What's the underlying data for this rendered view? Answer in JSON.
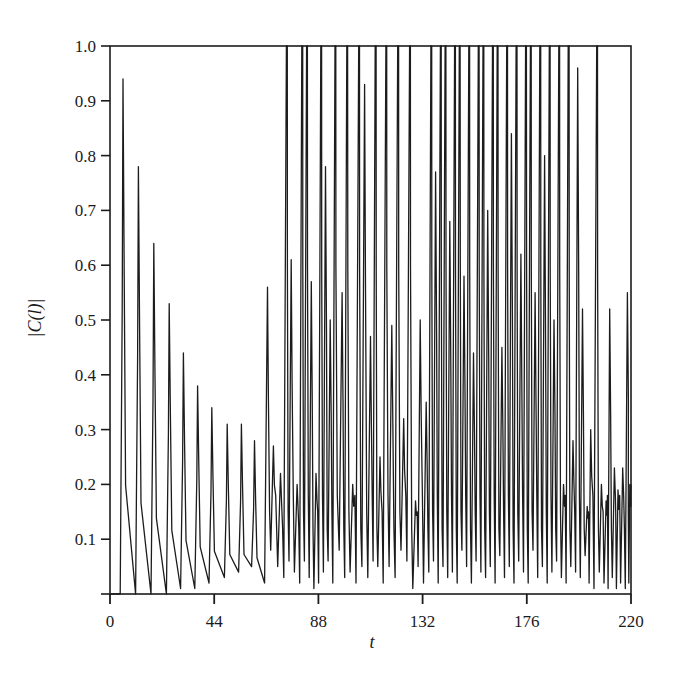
{
  "chart_data": {
    "type": "line",
    "title": "",
    "xlabel": "t",
    "ylabel": "|C(l)|",
    "xlim": [
      0,
      220
    ],
    "ylim": [
      0,
      1.0
    ],
    "grid": false,
    "legend": null,
    "x_ticks": [
      0,
      44,
      88,
      132,
      176,
      220
    ],
    "x_tick_labels": [
      "0",
      "44",
      "88",
      "132",
      "176",
      "220"
    ],
    "y_ticks": [
      0.1,
      0.2,
      0.3,
      0.4,
      0.5,
      0.6,
      0.7,
      0.8,
      0.9,
      1.0
    ],
    "y_tick_labels": [
      "0.1",
      "0.2",
      "0.3",
      "0.4",
      "0.5",
      "0.6",
      "0.7",
      "0.8",
      "0.9",
      "1.0"
    ],
    "series": [
      {
        "name": "|C(l)|",
        "peaks": [
          {
            "t": 5.5,
            "v": 0.94,
            "trough": 0.0
          },
          {
            "t": 12,
            "v": 0.78,
            "trough": 0.0
          },
          {
            "t": 18.5,
            "v": 0.64,
            "trough": 0.0
          },
          {
            "t": 25,
            "v": 0.53,
            "trough": 0.0
          },
          {
            "t": 31,
            "v": 0.44,
            "trough": 0.01
          },
          {
            "t": 37,
            "v": 0.38,
            "trough": 0.01
          },
          {
            "t": 43,
            "v": 0.34,
            "trough": 0.02
          },
          {
            "t": 49.5,
            "v": 0.31,
            "trough": 0.03
          },
          {
            "t": 55.5,
            "v": 0.31,
            "trough": 0.04
          },
          {
            "t": 61,
            "v": 0.28,
            "trough": 0.05
          },
          {
            "t": 66.5,
            "v": 0.56,
            "trough": 0.02
          },
          {
            "t": 69,
            "v": 0.27,
            "trough": 0.08
          },
          {
            "t": 72,
            "v": 0.22,
            "trough": 0.05
          },
          {
            "t": 74.5,
            "v": 1.0,
            "trough": 0.03
          },
          {
            "t": 76.5,
            "v": 0.61,
            "trough": 0.06
          },
          {
            "t": 79,
            "v": 0.2,
            "trough": 0.04
          },
          {
            "t": 81,
            "v": 1.0,
            "trough": 0.02
          },
          {
            "t": 83,
            "v": 1.0,
            "trough": 0.06
          },
          {
            "t": 85,
            "v": 0.57,
            "trough": 0.03
          },
          {
            "t": 87,
            "v": 0.22,
            "trough": 0.01
          },
          {
            "t": 89,
            "v": 1.0,
            "trough": 0.02
          },
          {
            "t": 91,
            "v": 0.78,
            "trough": 0.04
          },
          {
            "t": 93,
            "v": 0.5,
            "trough": 0.06
          },
          {
            "t": 95,
            "v": 1.0,
            "trough": 0.02
          },
          {
            "t": 98,
            "v": 0.55,
            "trough": 0.08
          },
          {
            "t": 100,
            "v": 1.0,
            "trough": 0.03
          },
          {
            "t": 102.5,
            "v": 0.2,
            "trough": 0.04
          },
          {
            "t": 105,
            "v": 1.0,
            "trough": 0.02
          },
          {
            "t": 107.5,
            "v": 0.93,
            "trough": 0.05
          },
          {
            "t": 110,
            "v": 0.47,
            "trough": 0.03
          },
          {
            "t": 112,
            "v": 1.0,
            "trough": 0.06
          },
          {
            "t": 114,
            "v": 0.25,
            "trough": 0.05
          },
          {
            "t": 116.5,
            "v": 1.0,
            "trough": 0.02
          },
          {
            "t": 119,
            "v": 0.49,
            "trough": 0.05
          },
          {
            "t": 121.5,
            "v": 1.0,
            "trough": 0.03
          },
          {
            "t": 124,
            "v": 0.32,
            "trough": 0.08
          },
          {
            "t": 126.5,
            "v": 1.0,
            "trough": 0.06
          },
          {
            "t": 129,
            "v": 0.17,
            "trough": 0.01
          },
          {
            "t": 131,
            "v": 0.5,
            "trough": 0.05
          },
          {
            "t": 133.5,
            "v": 0.35,
            "trough": 0.02
          },
          {
            "t": 135.5,
            "v": 1.0,
            "trough": 0.04
          },
          {
            "t": 137.5,
            "v": 0.77,
            "trough": 0.06
          },
          {
            "t": 139.5,
            "v": 1.0,
            "trough": 0.02
          },
          {
            "t": 141.5,
            "v": 1.0,
            "trough": 0.05
          },
          {
            "t": 143.5,
            "v": 0.68,
            "trough": 0.03
          },
          {
            "t": 145.5,
            "v": 1.0,
            "trough": 0.04
          },
          {
            "t": 147.5,
            "v": 1.0,
            "trough": 0.02
          },
          {
            "t": 149.5,
            "v": 0.58,
            "trough": 0.08
          },
          {
            "t": 151.5,
            "v": 1.0,
            "trough": 0.05
          },
          {
            "t": 153.5,
            "v": 0.44,
            "trough": 0.02
          },
          {
            "t": 155.5,
            "v": 1.0,
            "trough": 0.06
          },
          {
            "t": 157.5,
            "v": 1.0,
            "trough": 0.04
          },
          {
            "t": 159.5,
            "v": 0.7,
            "trough": 0.03
          },
          {
            "t": 161.5,
            "v": 1.0,
            "trough": 0.05
          },
          {
            "t": 163.5,
            "v": 1.0,
            "trough": 0.02
          },
          {
            "t": 165.5,
            "v": 0.45,
            "trough": 0.07
          },
          {
            "t": 167.5,
            "v": 1.0,
            "trough": 0.03
          },
          {
            "t": 169.5,
            "v": 0.84,
            "trough": 0.05
          },
          {
            "t": 171.5,
            "v": 1.0,
            "trough": 0.02
          },
          {
            "t": 173.5,
            "v": 0.62,
            "trough": 0.06
          },
          {
            "t": 175.5,
            "v": 1.0,
            "trough": 0.04
          },
          {
            "t": 177.5,
            "v": 1.0,
            "trough": 0.02
          },
          {
            "t": 179.5,
            "v": 0.55,
            "trough": 0.08
          },
          {
            "t": 181.5,
            "v": 1.0,
            "trough": 0.03
          },
          {
            "t": 183.5,
            "v": 0.8,
            "trough": 0.05
          },
          {
            "t": 185.5,
            "v": 1.0,
            "trough": 0.02
          },
          {
            "t": 187.5,
            "v": 0.5,
            "trough": 0.04
          },
          {
            "t": 189.5,
            "v": 1.0,
            "trough": 0.06
          },
          {
            "t": 191.5,
            "v": 0.2,
            "trough": 0.03
          },
          {
            "t": 193.5,
            "v": 1.0,
            "trough": 0.02
          },
          {
            "t": 195.5,
            "v": 0.28,
            "trough": 0.05
          },
          {
            "t": 197.5,
            "v": 0.96,
            "trough": 0.04
          },
          {
            "t": 199.5,
            "v": 0.52,
            "trough": 0.03
          },
          {
            "t": 201.5,
            "v": 0.16,
            "trough": 0.07
          },
          {
            "t": 203,
            "v": 0.3,
            "trough": 0.02
          },
          {
            "t": 205.5,
            "v": 1.0,
            "trough": 0.01
          },
          {
            "t": 207.5,
            "v": 0.2,
            "trough": 0.04
          },
          {
            "t": 209.5,
            "v": 0.17,
            "trough": 0.02
          },
          {
            "t": 211,
            "v": 0.52,
            "trough": 0.01
          },
          {
            "t": 213,
            "v": 0.23,
            "trough": 0.03
          },
          {
            "t": 214.5,
            "v": 0.19,
            "trough": 0.01
          },
          {
            "t": 216.5,
            "v": 0.23,
            "trough": 0.02
          },
          {
            "t": 218.5,
            "v": 0.55,
            "trough": 0.01
          },
          {
            "t": 219.5,
            "v": 0.2,
            "trough": 0.02
          }
        ]
      }
    ]
  },
  "style": {
    "line_color": "#1c1c1c",
    "axis_color": "#1c1c1c",
    "background": "#ffffff"
  },
  "plot_box": {
    "left": 110,
    "right": 631,
    "top": 46,
    "bottom": 594
  }
}
